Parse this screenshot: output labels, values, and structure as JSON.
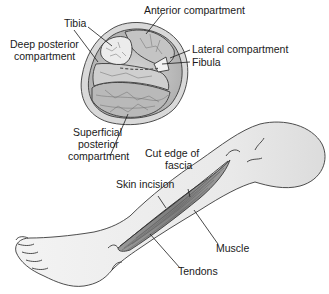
{
  "figure": {
    "cross_section": {
      "labels": {
        "tibia": "Tibia",
        "anterior": "Anterior compartment",
        "deep_posterior_line1": "Deep posterior",
        "deep_posterior_line2": "compartment",
        "lateral": "Lateral compartment",
        "fibula": "Fibula",
        "superficial_line1": "Superficial",
        "superficial_line2": "posterior",
        "superficial_line3": "compartment"
      }
    },
    "leg_view": {
      "labels": {
        "cut_edge_line1": "Cut edge of",
        "cut_edge_line2": "fascia",
        "skin_incision": "Skin incision",
        "muscle": "Muscle",
        "tendons": "Tendons"
      }
    },
    "colors": {
      "skin": "#eeeeee",
      "muscle": "#8a8a8a",
      "outline": "#3a3a3a",
      "compartment": "#c8c8c8",
      "bone": "#e4e4e4"
    }
  }
}
